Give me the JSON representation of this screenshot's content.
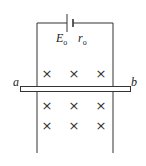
{
  "diagram": {
    "battery": {
      "emf_label": "E",
      "emf_sub": "o",
      "resistance_label": "r",
      "resistance_sub": "o"
    },
    "rod": {
      "left_label": "a",
      "right_label": "b"
    },
    "field": {
      "symbol": "×",
      "rows": 3,
      "cols": 3,
      "direction": "into page"
    },
    "colors": {
      "line": "#333333",
      "background": "#ffffff"
    }
  }
}
